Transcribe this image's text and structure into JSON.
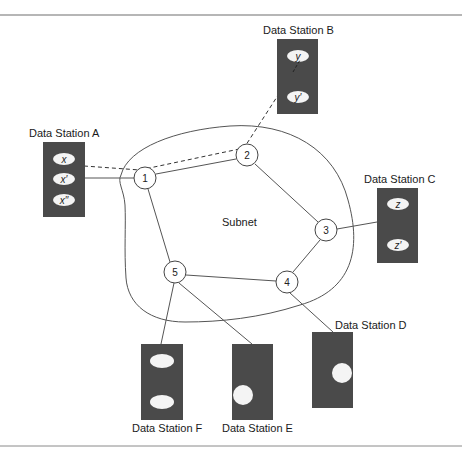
{
  "diagram": {
    "subnet_label": "Subnet",
    "colors": {
      "station_fill": "#4a4a4a",
      "line": "#555555",
      "rule": "#777777",
      "background": "#ffffff"
    },
    "nodes": [
      {
        "id": "1",
        "label": "1"
      },
      {
        "id": "2",
        "label": "2"
      },
      {
        "id": "3",
        "label": "3"
      },
      {
        "id": "4",
        "label": "4"
      },
      {
        "id": "5",
        "label": "5"
      }
    ],
    "stations": {
      "a": {
        "label": "Data Station A",
        "items": [
          "x",
          "x′",
          "x′′"
        ]
      },
      "b": {
        "label": "Data Station B",
        "items": [
          "y",
          "y′"
        ]
      },
      "c": {
        "label": "Data Station C",
        "items": [
          "z",
          "z′"
        ]
      },
      "d": {
        "label": "Data Station D",
        "items": []
      },
      "e": {
        "label": "Data Station E",
        "items": []
      },
      "f": {
        "label": "Data Station F",
        "items": []
      }
    },
    "links": [
      [
        "A",
        "1"
      ],
      [
        "1",
        "2"
      ],
      [
        "2",
        "3"
      ],
      [
        "3",
        "C"
      ],
      [
        "3",
        "4"
      ],
      [
        "4",
        "5"
      ],
      [
        "1",
        "5"
      ],
      [
        "4",
        "D"
      ],
      [
        "5",
        "E"
      ],
      [
        "5",
        "F"
      ]
    ],
    "dashed_path": [
      "A.x",
      "2",
      "B.y"
    ]
  }
}
